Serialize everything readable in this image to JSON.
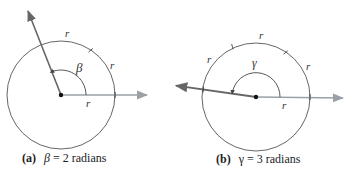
{
  "figures": [
    {
      "id": "a",
      "caption_tag": "(a)",
      "angle_symbol": "β",
      "caption_rest": " = 2 radians",
      "angle_radians": 2,
      "arc_labels": [
        "r",
        "r"
      ],
      "radius_label": "r",
      "center": [
        61,
        95
      ],
      "radius": 54
    },
    {
      "id": "b",
      "caption_tag": "(b)",
      "angle_symbol": "γ",
      "caption_rest": " = 3 radians",
      "angle_radians": 3,
      "arc_labels": [
        "r",
        "r",
        "r"
      ],
      "radius_label": "r",
      "center": [
        256,
        97
      ],
      "radius": 54
    }
  ],
  "colors": {
    "circle": "#555555",
    "terminal_ray": "#666666",
    "initial_ray": "#9aa0a6",
    "text": "#222222"
  }
}
